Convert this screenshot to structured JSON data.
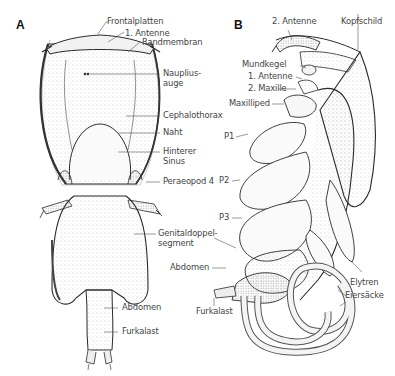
{
  "panels": [
    {
      "id": "A",
      "letter": "A",
      "labels": {
        "frontalplatten": "Frontalplatten",
        "antenne1": "1. Antenne",
        "randmembran": "Randmembran",
        "nauplius_1": "Nauplius-",
        "nauplius_2": "auge",
        "cephalothorax": "Cephalothorax",
        "naht": "Naht",
        "sinus_1": "Hinterer",
        "sinus_2": "Sinus",
        "peraeopod": "Peraeopod 4",
        "genital_1": "Genitaldoppel-",
        "genital_2": "segment",
        "abdomen": "Abdomen",
        "furkalast": "Furkalast"
      }
    },
    {
      "id": "B",
      "letter": "B",
      "labels": {
        "antenne2": "2. Antenne",
        "kopfschild": "Kopfschild",
        "mundkegel": "Mundkegel",
        "antenne1": "1. Antenne",
        "maxille2": "2. Maxille",
        "maxilliped": "Maxilliped",
        "p1": "P1",
        "p2": "P2",
        "p3": "P3",
        "abdomen": "Abdomen",
        "elytren": "Elytren",
        "eiersaecke": "Eiersäcke",
        "furkalast": "Furkalast"
      }
    }
  ],
  "colors": {
    "ink": "#2a2a2a",
    "stipple": "#8a8a8a",
    "leader": "#555555",
    "label": "#444444"
  }
}
